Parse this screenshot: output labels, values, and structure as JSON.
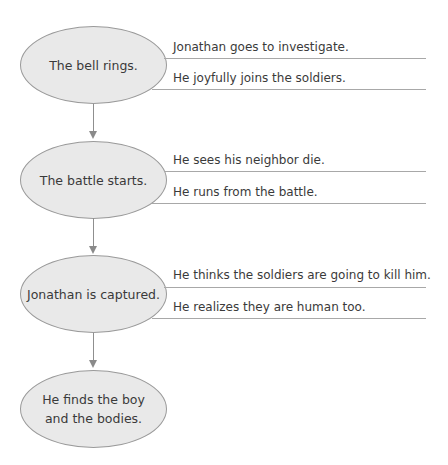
{
  "diagram": {
    "events": [
      {
        "label": "The bell rings.",
        "details": [
          "Jonathan goes to investigate.",
          "He joyfully joins the soldiers."
        ]
      },
      {
        "label": "The battle starts.",
        "details": [
          "He sees his neighbor die.",
          "He runs from the battle."
        ]
      },
      {
        "label": "Jonathan is captured.",
        "details": [
          "He thinks the soldiers are going to kill him.",
          "He realizes they are human too."
        ]
      },
      {
        "label_lines": [
          "He finds the boy",
          "and the bodies."
        ],
        "details": []
      }
    ],
    "colors": {
      "ellipse_fill": "#e9e9e9",
      "ellipse_border": "#9a9a9a",
      "line": "#a8a8a8",
      "text": "#3a3a3a"
    }
  }
}
